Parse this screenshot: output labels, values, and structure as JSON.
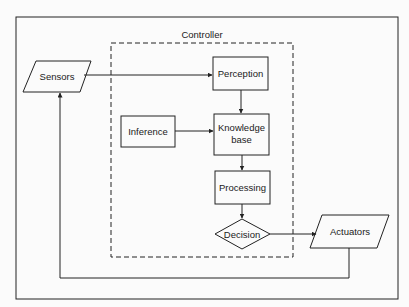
{
  "diagram": {
    "container_label": "Controller",
    "nodes": {
      "sensors": {
        "label": "Sensors",
        "shape": "parallelogram"
      },
      "perception": {
        "label": "Perception",
        "shape": "rectangle"
      },
      "knowledge": {
        "label_line1": "Knowledge",
        "label_line2": "base",
        "shape": "rectangle"
      },
      "inference": {
        "label": "Inference",
        "shape": "rectangle"
      },
      "processing": {
        "label": "Processing",
        "shape": "rectangle"
      },
      "decision": {
        "label": "Decision",
        "shape": "diamond"
      },
      "actuators": {
        "label": "Actuators",
        "shape": "parallelogram"
      }
    },
    "edges": [
      {
        "from": "Sensors",
        "to": "Perception"
      },
      {
        "from": "Perception",
        "to": "Knowledge base"
      },
      {
        "from": "Inference",
        "to": "Knowledge base"
      },
      {
        "from": "Knowledge base",
        "to": "Processing"
      },
      {
        "from": "Processing",
        "to": "Decision"
      },
      {
        "from": "Decision",
        "to": "Actuators"
      },
      {
        "from": "Actuators",
        "to": "Sensors"
      }
    ],
    "colors": {
      "stroke": "#222222",
      "background": "#fbfbfb",
      "text": "#1a1a1a"
    }
  }
}
